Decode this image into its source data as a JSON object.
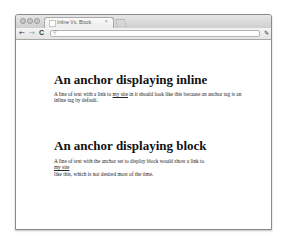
{
  "browser": {
    "tab": {
      "title": "Inline Vs. Block",
      "close_glyph": "×"
    },
    "toolbar": {
      "back_icon": "←",
      "forward_icon": "→",
      "reload_icon": "C",
      "search_glyph": "🔍",
      "address_value": "",
      "wrench_icon": "🔧"
    }
  },
  "page": {
    "section_inline": {
      "heading": "An anchor displaying inline",
      "text_before": "A line of text with a link to ",
      "link": "my site",
      "text_after": " in it should look like this because an anchor tag is an inline tag by default."
    },
    "section_block": {
      "heading": "An anchor displaying block",
      "text_before": "A line of text with the anchor set to display block would show a link to",
      "link": "my site",
      "text_after": "like this, which is not desired most of the time."
    }
  }
}
